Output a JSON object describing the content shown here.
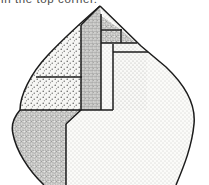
{
  "figure": {
    "caption_clipped": "in the top corner.",
    "background_color": "#ffffff",
    "outline_color": "#1a1a1a",
    "caption_color": "#4a4a4a"
  },
  "regions": [
    {
      "id": "upper-left-stipple",
      "label": "Upper left stippled wedge",
      "fill_pattern": "coarse-dot-stipple",
      "fill_color": "#f5f5f3",
      "dot_color": "#4a4a4a"
    },
    {
      "id": "lower-left-noise",
      "label": "Lower left fine noise region",
      "fill_pattern": "fine-noise-crosshatch",
      "fill_color": "#efefec",
      "dot_color": "#5a5a5a"
    },
    {
      "id": "central-column",
      "label": "Central vertical textured column",
      "fill_pattern": "vertical-streak-noise",
      "fill_color": "#ededea",
      "dot_color": "#555555"
    },
    {
      "id": "apex-right-wedge",
      "label": "Apex right hatched wedge",
      "fill_pattern": "fine-noise-crosshatch",
      "fill_color": "#eeeeeb",
      "dot_color": "#555555"
    },
    {
      "id": "right-body",
      "label": "Right main body light dotted region",
      "fill_pattern": "light-fine-dot",
      "fill_color": "#fafaf8",
      "dot_color": "#9a9a9a"
    }
  ],
  "geometry": {
    "apex": {
      "x": 100,
      "y": 6
    },
    "left_curve_extent": {
      "x": 7,
      "y": 118
    },
    "right_curve_extent": {
      "x": 196,
      "y": 110
    },
    "vertical_divider_x": 66,
    "column_left_x": 81,
    "column_right_x": 101,
    "outer_column_right_x": 113
  },
  "internal_lines": [
    {
      "id": "left-horizontal-rule",
      "y": 77,
      "x1": 36,
      "x2": 82
    },
    {
      "id": "apex-inner-horizontal",
      "y": 43,
      "x1": 101,
      "x2": 136
    },
    {
      "id": "apex-upper-horizontal",
      "y": 30,
      "x1": 101,
      "x2": 121
    },
    {
      "id": "right-horizontal-rule",
      "y": 52,
      "x1": 113,
      "x2": 147
    }
  ]
}
